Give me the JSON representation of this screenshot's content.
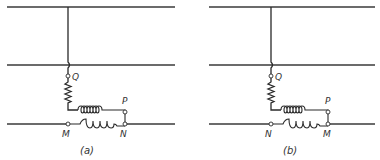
{
  "figure": {
    "panels": [
      {
        "id": "a",
        "caption": "(a)",
        "labels": {
          "top_terminal": "Q",
          "right_terminal": "P",
          "bottom_left": "M",
          "bottom_right": "N"
        }
      },
      {
        "id": "b",
        "caption": "(b)",
        "labels": {
          "top_terminal": "Q",
          "right_terminal": "P",
          "bottom_left": "N",
          "bottom_right": "M"
        }
      }
    ],
    "lines": [
      "top conductor",
      "middle conductor",
      "bottom conductor"
    ],
    "components": [
      "resistor (zigzag)",
      "series coil",
      "line coil"
    ]
  }
}
